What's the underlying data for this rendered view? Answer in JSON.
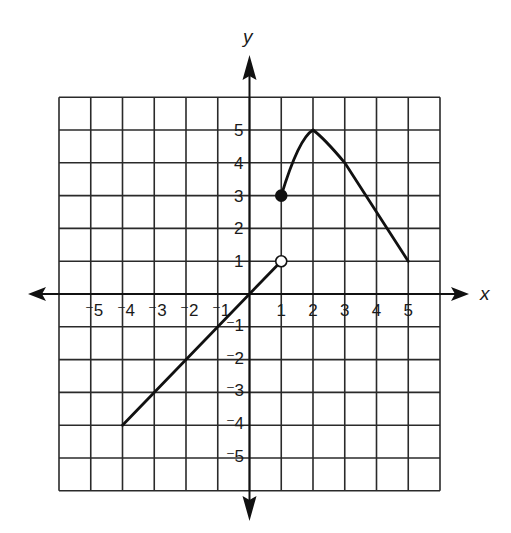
{
  "chart_data": {
    "type": "line",
    "title": "",
    "xlabel": "x",
    "ylabel": "y",
    "xlim": [
      -6,
      6
    ],
    "ylim": [
      -6,
      6
    ],
    "grid": true,
    "x_ticks": [
      -5,
      -4,
      -3,
      -2,
      -1,
      1,
      2,
      3,
      4,
      5
    ],
    "y_ticks": [
      -5,
      -4,
      -3,
      -2,
      -1,
      1,
      2,
      3,
      4,
      5
    ],
    "x_tick_labels": [
      "⁻5",
      "⁻4",
      "⁻3",
      "⁻2",
      "⁻1",
      "1",
      "2",
      "3",
      "4",
      "5"
    ],
    "y_tick_labels": [
      "⁻5",
      "⁻4",
      "⁻3",
      "⁻2",
      "⁻1",
      "1",
      "2",
      "3",
      "4",
      "5"
    ],
    "series": [
      {
        "name": "linear piece",
        "kind": "segment",
        "points": [
          [
            -4,
            -4
          ],
          [
            1,
            1
          ]
        ],
        "left_endpoint": "none",
        "right_endpoint": "open"
      },
      {
        "name": "curved piece",
        "kind": "curve",
        "points": [
          [
            1,
            3
          ],
          [
            1.5,
            4.3
          ],
          [
            2,
            5
          ],
          [
            3,
            4
          ],
          [
            4,
            2.5
          ],
          [
            5,
            1
          ]
        ],
        "left_endpoint": "closed",
        "right_endpoint": "none"
      }
    ],
    "points": [
      {
        "x": 1,
        "y": 3,
        "style": "closed"
      },
      {
        "x": 1,
        "y": 1,
        "style": "open"
      }
    ]
  },
  "labels": {
    "x_axis": "x",
    "y_axis": "y"
  }
}
